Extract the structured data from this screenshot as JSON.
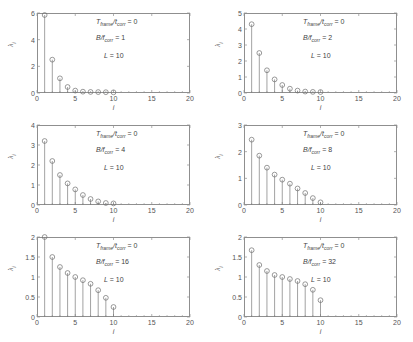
{
  "figure": {
    "background": "#ffffff",
    "axis_color": "#8f8f8f",
    "marker_color": "#6e6e6e",
    "stem_color": "#7a7a7a",
    "xlabel": "i",
    "ylabel_base": "λ",
    "ylabel_sub": "i"
  },
  "chart_data": [
    {
      "type": "scatter",
      "panel_id": "panel-1",
      "title": "",
      "xlabel": "i",
      "ylabel": "λ_i",
      "xlim": [
        0,
        20
      ],
      "ylim": [
        0,
        6
      ],
      "xticks": [
        0,
        5,
        10,
        15,
        20
      ],
      "yticks": [
        0,
        2,
        4,
        6
      ],
      "xticklabels": [
        "0",
        "5",
        "10",
        "15",
        "20"
      ],
      "yticklabels": [
        "0",
        "2",
        "4",
        "6"
      ],
      "grid": false,
      "legend": null,
      "annotations": [
        {
          "text_prefix": "T",
          "sub1": "frame",
          "mid": "/t",
          "sub2": "corr",
          "value": "0",
          "full": "T_frame/t_corr = 0"
        },
        {
          "text_prefix": "B/f",
          "sub1": "",
          "mid": "",
          "sub2": "corr",
          "value": "1",
          "full": "B/f_corr = 1"
        },
        {
          "text_prefix": "L",
          "sub1": "",
          "mid": "",
          "sub2": "",
          "value": "10",
          "full": "L = 10"
        }
      ],
      "x": [
        1,
        2,
        3,
        4,
        5,
        6,
        7,
        8,
        9,
        10
      ],
      "values": [
        5.85,
        2.5,
        1.1,
        0.45,
        0.18,
        0.1,
        0.08,
        0.07,
        0.06,
        0.05
      ]
    },
    {
      "type": "scatter",
      "panel_id": "panel-2",
      "title": "",
      "xlabel": "i",
      "ylabel": "λ_i",
      "xlim": [
        0,
        20
      ],
      "ylim": [
        0,
        5
      ],
      "xticks": [
        0,
        5,
        10,
        15,
        20
      ],
      "yticks": [
        0,
        1,
        2,
        3,
        4,
        5
      ],
      "xticklabels": [
        "0",
        "5",
        "10",
        "15",
        "20"
      ],
      "yticklabels": [
        "0",
        "1",
        "2",
        "3",
        "4",
        "5"
      ],
      "grid": false,
      "legend": null,
      "annotations": [
        {
          "full": "T_frame/t_corr = 0"
        },
        {
          "full": "B/f_corr = 2"
        },
        {
          "full": "L = 10"
        }
      ],
      "x": [
        1,
        2,
        3,
        4,
        5,
        6,
        7,
        8,
        9,
        10
      ],
      "values": [
        4.3,
        2.5,
        1.42,
        0.85,
        0.5,
        0.27,
        0.15,
        0.09,
        0.07,
        0.06
      ]
    },
    {
      "type": "scatter",
      "panel_id": "panel-3",
      "title": "",
      "xlabel": "i",
      "ylabel": "λ_i",
      "xlim": [
        0,
        20
      ],
      "ylim": [
        0,
        4
      ],
      "xticks": [
        0,
        5,
        10,
        15,
        20
      ],
      "yticks": [
        0,
        1,
        2,
        3,
        4
      ],
      "xticklabels": [
        "0",
        "5",
        "10",
        "15",
        "20"
      ],
      "yticklabels": [
        "0",
        "1",
        "2",
        "3",
        "4"
      ],
      "grid": false,
      "legend": null,
      "annotations": [
        {
          "full": "T_frame/t_corr = 0"
        },
        {
          "full": "B/f_corr = 4"
        },
        {
          "full": "L = 10"
        }
      ],
      "x": [
        1,
        2,
        3,
        4,
        5,
        6,
        7,
        8,
        9,
        10
      ],
      "values": [
        3.2,
        2.2,
        1.5,
        1.08,
        0.78,
        0.5,
        0.3,
        0.18,
        0.1,
        0.08
      ]
    },
    {
      "type": "scatter",
      "panel_id": "panel-4",
      "title": "",
      "xlabel": "i",
      "ylabel": "λ_i",
      "xlim": [
        0,
        20
      ],
      "ylim": [
        0,
        3
      ],
      "xticks": [
        0,
        5,
        10,
        15,
        20
      ],
      "yticks": [
        0,
        1,
        2,
        3
      ],
      "xticklabels": [
        "0",
        "1",
        "2",
        "3"
      ],
      "yticklabels": [
        "0",
        "1",
        "2",
        "3"
      ],
      "grid": false,
      "legend": null,
      "annotations": [
        {
          "full": "T_frame/t_corr = 0"
        },
        {
          "full": "B/f_corr = 8"
        },
        {
          "full": "L = 10"
        }
      ],
      "x": [
        1,
        2,
        3,
        4,
        5,
        6,
        7,
        8,
        9,
        10
      ],
      "values": [
        2.45,
        1.85,
        1.4,
        1.14,
        0.95,
        0.8,
        0.62,
        0.45,
        0.26,
        0.1
      ]
    },
    {
      "type": "scatter",
      "panel_id": "panel-5",
      "title": "",
      "xlabel": "i",
      "ylabel": "λ_i",
      "xlim": [
        0,
        20
      ],
      "ylim": [
        0,
        2
      ],
      "xticks": [
        0,
        5,
        10,
        15,
        20
      ],
      "yticks": [
        0,
        0.5,
        1,
        1.5,
        2
      ],
      "xticklabels": [
        "0",
        "5",
        "10",
        "15",
        "20"
      ],
      "yticklabels": [
        "0",
        "0.5",
        "1",
        "1.5",
        "2"
      ],
      "grid": false,
      "legend": null,
      "annotations": [
        {
          "full": "T_frame/t_corr = 0"
        },
        {
          "full": "B/f_corr = 16"
        },
        {
          "full": "L = 10"
        }
      ],
      "x": [
        1,
        2,
        3,
        4,
        5,
        6,
        7,
        8,
        9,
        10
      ],
      "values": [
        2.0,
        1.5,
        1.25,
        1.1,
        1.0,
        0.92,
        0.83,
        0.67,
        0.48,
        0.25
      ]
    },
    {
      "type": "scatter",
      "panel_id": "panel-6",
      "title": "",
      "xlabel": "i",
      "ylabel": "λ_i",
      "xlim": [
        0,
        20
      ],
      "ylim": [
        0,
        2
      ],
      "xticks": [
        0,
        5,
        10,
        15,
        20
      ],
      "yticks": [
        0,
        0.5,
        1,
        1.5,
        2
      ],
      "xticklabels": [
        "0",
        "5",
        "10",
        "15",
        "20"
      ],
      "yticklabels": [
        "0",
        "0.5",
        "1",
        "1.5",
        "2"
      ],
      "grid": false,
      "legend": null,
      "annotations": [
        {
          "full": "T_frame/t_corr = 0"
        },
        {
          "full": "B/f_corr = 32"
        },
        {
          "full": "L = 10"
        }
      ],
      "x": [
        1,
        2,
        3,
        4,
        5,
        6,
        7,
        8,
        9,
        10
      ],
      "values": [
        1.67,
        1.3,
        1.15,
        1.05,
        1.0,
        0.95,
        0.9,
        0.82,
        0.68,
        0.42
      ]
    }
  ],
  "panel_annotations": {
    "tframe_label": "T",
    "tframe_sub": "frame",
    "tcorr_mid": "/t",
    "tcorr_sub": "corr",
    "tframe_value": "= 0",
    "b_label": "B/f",
    "b_sub": "corr",
    "b_values": [
      "= 1",
      "= 2",
      "= 4",
      "= 8",
      "= 16",
      "= 32"
    ],
    "l_label": "L",
    "l_value": "= 10"
  }
}
